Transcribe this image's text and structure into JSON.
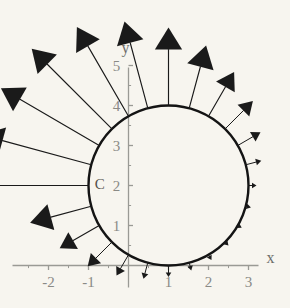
{
  "figure": {
    "background_color": "#f7f5ef",
    "axis_color": "#9a9a95",
    "curve_color": "#141414",
    "vector_color": "#1a1a1a",
    "label_color": "#8a8a86"
  },
  "axes": {
    "x_axis_label": "x",
    "y_axis_label": "y",
    "x_ticks": [
      {
        "value": -2,
        "label": "-2"
      },
      {
        "value": -1,
        "label": "-1"
      },
      {
        "value": 1,
        "label": "1"
      },
      {
        "value": 2,
        "label": "2"
      },
      {
        "value": 3,
        "label": "3"
      }
    ],
    "y_ticks": [
      {
        "value": 1,
        "label": "1"
      },
      {
        "value": 2,
        "label": "2"
      },
      {
        "value": 3,
        "label": "3"
      },
      {
        "value": 4,
        "label": "4"
      },
      {
        "value": 5,
        "label": "5"
      }
    ],
    "x_minor_tick_values": [
      -2.5,
      -1.5,
      -0.5,
      0.5,
      1.5,
      2.5
    ],
    "y_minor_tick_values": [
      0.5,
      1.5,
      2.5,
      3.5,
      4.5
    ],
    "xlim": [
      -2.9,
      3.6
    ],
    "ylim": [
      -0.55,
      5.6
    ]
  },
  "annotations": {
    "curve_label": "C"
  },
  "chart_data": {
    "type": "scatter",
    "title": "",
    "xlabel": "x",
    "ylabel": "y",
    "xlim": [
      -2.9,
      3.6
    ],
    "ylim": [
      -0.55,
      5.6
    ],
    "grid": false,
    "legend": "none",
    "annotations": [
      {
        "text": "C",
        "x": -0.7,
        "y": 2.05
      },
      {
        "text": "x",
        "x": 3.5,
        "y": 0.3
      },
      {
        "text": "y",
        "x": 0.0,
        "y": 5.5
      }
    ],
    "series": [
      {
        "name": "circle C",
        "type": "circle",
        "center": [
          1,
          2
        ],
        "radius": 2,
        "stroke_width": 2.4,
        "color": "#141414"
      },
      {
        "name": "outward normal vector field",
        "type": "vectors",
        "color": "#1a1a1a",
        "description": "Arrows attached to points on the circle, pointing radially outward; length shrinks from left (long) to right (short).",
        "vectors": [
          {
            "base": [
              -1.0,
              2.0
            ],
            "tip": [
              -3.85,
              2.0
            ],
            "angle_deg": 180.0,
            "length": 2.85
          },
          {
            "base": [
              -0.932,
              2.518
            ],
            "tip": [
              -3.68,
              3.268
            ],
            "angle_deg": 165.0,
            "length": 2.85
          },
          {
            "base": [
              -0.732,
              3.0
            ],
            "tip": [
              -3.19,
              4.43
            ],
            "angle_deg": 150.0,
            "length": 2.84
          },
          {
            "base": [
              -0.414,
              3.414
            ],
            "tip": [
              -2.42,
              5.42
            ],
            "angle_deg": 135.0,
            "length": 2.84
          },
          {
            "base": [
              0.0,
              3.732
            ],
            "tip": [
              -1.29,
              5.96
            ],
            "angle_deg": 120.0,
            "length": 2.57
          },
          {
            "base": [
              0.482,
              3.932
            ],
            "tip": [
              -0.1,
              6.1
            ],
            "angle_deg": 105.0,
            "length": 2.24
          },
          {
            "base": [
              1.0,
              4.0
            ],
            "tip": [
              1.0,
              5.95
            ],
            "angle_deg": 90.0,
            "length": 1.95
          },
          {
            "base": [
              1.518,
              3.932
            ],
            "tip": [
              1.94,
              5.5
            ],
            "angle_deg": 75.0,
            "length": 1.62
          },
          {
            "base": [
              2.0,
              3.732
            ],
            "tip": [
              2.64,
              4.84
            ],
            "angle_deg": 60.0,
            "length": 1.28
          },
          {
            "base": [
              2.414,
              3.414
            ],
            "tip": [
              3.11,
              4.11
            ],
            "angle_deg": 45.0,
            "length": 0.98
          },
          {
            "base": [
              2.732,
              3.0
            ],
            "tip": [
              3.3,
              3.33
            ],
            "angle_deg": 30.0,
            "length": 0.66
          },
          {
            "base": [
              2.932,
              2.518
            ],
            "tip": [
              3.32,
              2.62
            ],
            "angle_deg": 15.0,
            "length": 0.4
          },
          {
            "base": [
              3.0,
              2.0
            ],
            "tip": [
              3.2,
              2.0
            ],
            "angle_deg": 0.0,
            "length": 0.2
          },
          {
            "base": [
              2.932,
              1.482
            ],
            "tip": [
              3.06,
              1.448
            ],
            "angle_deg": -15.0,
            "length": 0.13
          },
          {
            "base": [
              2.732,
              1.0
            ],
            "tip": [
              2.83,
              0.942
            ],
            "angle_deg": -30.0,
            "length": 0.11
          },
          {
            "base": [
              2.414,
              0.586
            ],
            "tip": [
              2.5,
              0.5
            ],
            "angle_deg": -45.0,
            "length": 0.12
          },
          {
            "base": [
              2.0,
              0.268
            ],
            "tip": [
              2.075,
              0.138
            ],
            "angle_deg": -60.0,
            "length": 0.15
          },
          {
            "base": [
              1.518,
              0.068
            ],
            "tip": [
              1.57,
              -0.122
            ],
            "angle_deg": -75.0,
            "length": 0.2
          },
          {
            "base": [
              1.0,
              0.0
            ],
            "tip": [
              1.0,
              -0.29
            ],
            "angle_deg": -90.0,
            "length": 0.29
          },
          {
            "base": [
              0.482,
              0.068
            ],
            "tip": [
              0.375,
              -0.33
            ],
            "angle_deg": -105.0,
            "length": 0.41
          },
          {
            "base": [
              0.0,
              0.268
            ],
            "tip": [
              -0.3,
              -0.25
            ],
            "angle_deg": -120.0,
            "length": 0.6
          },
          {
            "base": [
              -0.414,
              0.586
            ],
            "tip": [
              -1.02,
              -0.02
            ],
            "angle_deg": -135.0,
            "length": 0.86
          },
          {
            "base": [
              -0.732,
              1.0
            ],
            "tip": [
              -1.72,
              0.43
            ],
            "angle_deg": -150.0,
            "length": 1.14
          },
          {
            "base": [
              -0.932,
              1.482
            ],
            "tip": [
              -2.46,
              1.07
            ],
            "angle_deg": -165.0,
            "length": 1.58
          }
        ]
      }
    ]
  }
}
